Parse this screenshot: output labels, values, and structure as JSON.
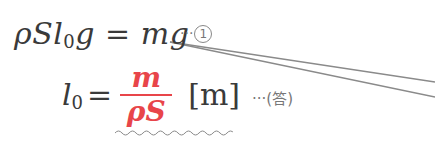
{
  "equation1": {
    "lhs": [
      "ρ",
      "S",
      "l",
      "0",
      "g"
    ],
    "equals": "=",
    "rhs": "mg",
    "marker_dots": "···",
    "marker_label": "1"
  },
  "equation2": {
    "lhs_var": "l",
    "lhs_sub": "0",
    "equals": "=",
    "numerator": "m",
    "denominator": "ρS",
    "unit": "[m]",
    "answer_dots": "···",
    "answer_label": "(答)"
  },
  "colors": {
    "text": "#3a3a3a",
    "highlight": "#e8454a",
    "annotation": "#777777"
  }
}
